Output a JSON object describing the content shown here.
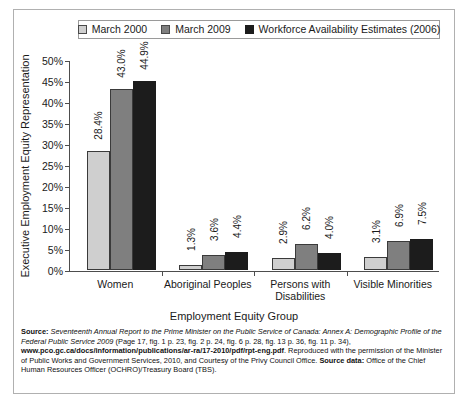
{
  "chart_data": {
    "type": "bar",
    "title": "",
    "xlabel": "Employment Equity Group",
    "ylabel": "Executive Employment Equity Representation",
    "ylim": [
      0,
      50
    ],
    "ytick_labels": [
      "0%",
      "5%",
      "10%",
      "15%",
      "20%",
      "25%",
      "30%",
      "35%",
      "40%",
      "45%",
      "50%"
    ],
    "ytick_values": [
      0,
      5,
      10,
      15,
      20,
      25,
      30,
      35,
      40,
      45,
      50
    ],
    "grid": false,
    "legend_position": "top",
    "categories": [
      "Women",
      "Aboriginal Peoples",
      "Persons with Disabilities",
      "Visible Minorities"
    ],
    "series": [
      {
        "name": "March 2000",
        "color": "#cfcfcf",
        "values": [
          28.4,
          1.3,
          2.9,
          3.1
        ],
        "labels": [
          "28.4%",
          "1.3%",
          "2.9%",
          "3.1%"
        ]
      },
      {
        "name": "March 2009",
        "color": "#7f7f7f",
        "values": [
          43.0,
          3.6,
          6.2,
          6.9
        ],
        "labels": [
          "43.0%",
          "3.6%",
          "6.2%",
          "6.9%"
        ]
      },
      {
        "name": "Workforce Availability Estimates (2006)",
        "color": "#1c1c1c",
        "values": [
          44.9,
          4.4,
          4.0,
          7.5
        ],
        "labels": [
          "44.9%",
          "4.4%",
          "4.0%",
          "7.5%"
        ]
      }
    ]
  },
  "legend": {
    "items": [
      {
        "label": "March 2000"
      },
      {
        "label": "March 2009"
      },
      {
        "label": "Workforce Availability Estimates (2006)"
      }
    ]
  },
  "footnote": {
    "source_label": "Source:",
    "title_italic": " Seventeenth Annual Report to the Prime Minister on the Public Service of Canada: Annex A: Demographic Profile of the Federal Public Service 2009",
    "pages": " (Page 17, fig. 1 p. 23, fig. 2 p. 24, fig. 6 p. 28, fig. 13 p. 36, fig. 11 p. 34), ",
    "url": "www.pco.gc.ca/docs/information/publications/ar-ra/17-2010/pdf/rpt-eng.pdf",
    "permission": ". Reproduced with the permission of the Minister of Public Works and Government Services, 2010, and Courtesy of the Privy Council Office. ",
    "source_data_label": "Source data:",
    "source_data_text": " Office of the Chief Human Resources Officer (OCHRO)/Treasury Board (TBS)."
  }
}
